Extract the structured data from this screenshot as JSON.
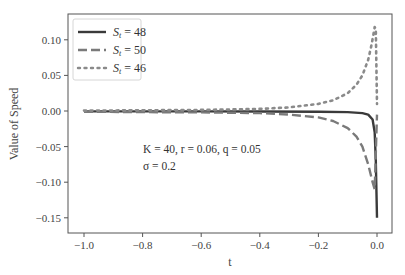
{
  "chart_data": {
    "type": "line",
    "title": "",
    "xlabel": "t",
    "ylabel": "Value of Speed",
    "xlim": [
      -1.05,
      0.05
    ],
    "ylim": [
      -0.165,
      0.135
    ],
    "xticks": [
      "−1.0",
      "−0.8",
      "−0.6",
      "−0.4",
      "−0.2",
      "0.0"
    ],
    "xtick_values": [
      -1.0,
      -0.8,
      -0.6,
      -0.4,
      -0.2,
      0.0
    ],
    "yticks": [
      "0.10",
      "0.05",
      "0.00",
      "−0.05",
      "−0.10",
      "−0.15"
    ],
    "ytick_values": [
      0.1,
      0.05,
      0.0,
      -0.05,
      -0.1,
      -0.15
    ],
    "grid": false,
    "legend_position": "upper left",
    "annotations": [
      "K = 40, r = 0.06, q = 0.05",
      "σ = 0.2"
    ],
    "series": [
      {
        "name": "S_t = 48",
        "style": "solid",
        "color": "#3a3a3a",
        "x": [
          -1.0,
          -0.8,
          -0.6,
          -0.4,
          -0.2,
          -0.1,
          -0.05,
          -0.03,
          -0.015,
          -0.008,
          -0.004,
          -0.002,
          0.0
        ],
        "y": [
          -0.0005,
          -0.0005,
          -0.0006,
          -0.0007,
          -0.001,
          -0.0015,
          -0.003,
          -0.005,
          -0.012,
          -0.03,
          -0.07,
          -0.11,
          -0.15
        ]
      },
      {
        "name": "S_t = 50",
        "style": "dashed",
        "color": "#7a7a7a",
        "x": [
          -1.0,
          -0.8,
          -0.6,
          -0.4,
          -0.3,
          -0.2,
          -0.15,
          -0.1,
          -0.07,
          -0.05,
          -0.03,
          -0.015,
          -0.008,
          0.0
        ],
        "y": [
          -0.001,
          -0.0015,
          -0.002,
          -0.003,
          -0.005,
          -0.009,
          -0.014,
          -0.024,
          -0.036,
          -0.05,
          -0.075,
          -0.1,
          -0.11,
          -0.005
        ]
      },
      {
        "name": "S_t = 46",
        "style": "dotted",
        "color": "#8a8a8a",
        "x": [
          -1.0,
          -0.8,
          -0.6,
          -0.4,
          -0.3,
          -0.2,
          -0.15,
          -0.1,
          -0.07,
          -0.05,
          -0.03,
          -0.02,
          -0.012,
          -0.008,
          -0.004,
          0.0
        ],
        "y": [
          0.0005,
          0.001,
          0.0015,
          0.003,
          0.005,
          0.01,
          0.015,
          0.025,
          0.037,
          0.05,
          0.072,
          0.09,
          0.108,
          0.118,
          0.115,
          0.01
        ]
      }
    ]
  },
  "legend": {
    "items": [
      {
        "label_sym": "S",
        "label_sub": "t",
        "label_rest": " = 48"
      },
      {
        "label_sym": "S",
        "label_sub": "t",
        "label_rest": " = 50"
      },
      {
        "label_sym": "S",
        "label_sub": "t",
        "label_rest": " = 46"
      }
    ]
  }
}
